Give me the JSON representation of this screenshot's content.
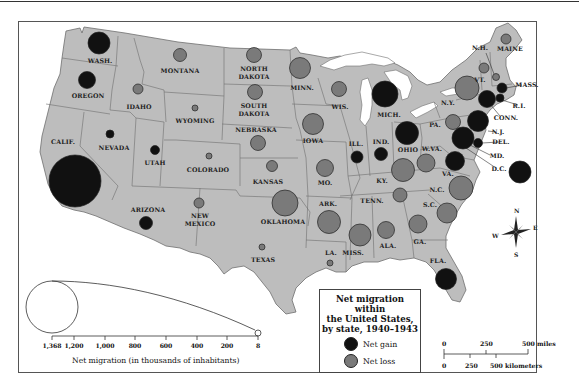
{
  "title": "Net migration within the United States, by state, 1940–1943",
  "colors": {
    "land": "#bdbdbd",
    "border": "#6e6e6e",
    "water": "#ffffff",
    "gain": "#111111",
    "loss": "#7a7a7a",
    "frame": "#555555"
  },
  "legend": {
    "title_line1": "Net migration within",
    "title_line2": "the United States,",
    "title_line3": "by state, 1940–1943",
    "gain_label": "Net gain",
    "loss_label": "Net loss"
  },
  "size_key": {
    "title": "Net migration (in thousands of inhabitants)",
    "ticks": [
      {
        "label": "1,368",
        "x": 52
      },
      {
        "label": "1,200",
        "x": 74
      },
      {
        "label": "1,000",
        "x": 105
      },
      {
        "label": "800",
        "x": 135
      },
      {
        "label": "600",
        "x": 166
      },
      {
        "label": "400",
        "x": 197
      },
      {
        "label": "200",
        "x": 227
      },
      {
        "label": "8",
        "x": 258
      }
    ]
  },
  "scale_bar": {
    "miles_labels": [
      "0",
      "250",
      "500 miles"
    ],
    "km_labels": [
      "0",
      "250",
      "500 kilometers"
    ]
  },
  "compass": {
    "n": "N",
    "s": "S",
    "e": "E",
    "w": "W"
  },
  "chart_data": {
    "type": "proportional-symbol-map",
    "title": "Net migration within the United States, by state, 1940–1943",
    "size_legend_label": "Net migration (in thousands of inhabitants)",
    "size_legend_range": [
      8,
      1368
    ],
    "size_legend_ticks": [
      1368,
      1200,
      1000,
      800,
      600,
      400,
      200,
      8
    ],
    "categories": [
      "Net gain",
      "Net loss"
    ],
    "states": [
      {
        "name": "WASH.",
        "type": "gain",
        "cx": 99,
        "cy": 43,
        "r": 11
      },
      {
        "name": "OREGON",
        "type": "gain",
        "cx": 87,
        "cy": 80,
        "r": 8.5
      },
      {
        "name": "CALIF.",
        "type": "gain",
        "cx": 75,
        "cy": 181,
        "r": 26
      },
      {
        "name": "NEVADA",
        "type": "gain",
        "cx": 110,
        "cy": 134,
        "r": 4
      },
      {
        "name": "IDAHO",
        "type": "loss",
        "cx": 138,
        "cy": 89,
        "r": 5
      },
      {
        "name": "MONTANA",
        "type": "loss",
        "cx": 180,
        "cy": 55,
        "r": 6.5
      },
      {
        "name": "WYOMING",
        "type": "loss",
        "cx": 195,
        "cy": 108,
        "r": 3
      },
      {
        "name": "UTAH",
        "type": "gain",
        "cx": 155,
        "cy": 150,
        "r": 4.5
      },
      {
        "name": "COLORADO",
        "type": "loss",
        "cx": 209,
        "cy": 156,
        "r": 3
      },
      {
        "name": "ARIZONA",
        "type": "gain",
        "cx": 146,
        "cy": 223,
        "r": 6.5
      },
      {
        "name": "NEW MEXICO",
        "type": "loss",
        "cx": 199,
        "cy": 203,
        "r": 5
      },
      {
        "name": "NORTH DAKOTA",
        "type": "loss",
        "cx": 254,
        "cy": 55,
        "r": 7.5
      },
      {
        "name": "SOUTH DAKOTA",
        "type": "loss",
        "cx": 255,
        "cy": 92,
        "r": 7.5
      },
      {
        "name": "NEBRASKA",
        "type": "loss",
        "cx": 258,
        "cy": 143,
        "r": 7.5
      },
      {
        "name": "KANSAS",
        "type": "loss",
        "cx": 272,
        "cy": 166,
        "r": 5.5
      },
      {
        "name": "OKLAHOMA",
        "type": "loss",
        "cx": 285,
        "cy": 203,
        "r": 13
      },
      {
        "name": "TEXAS",
        "type": "loss",
        "cx": 262,
        "cy": 247,
        "r": 3
      },
      {
        "name": "MINN.",
        "type": "loss",
        "cx": 300,
        "cy": 68,
        "r": 10.5
      },
      {
        "name": "IOWA",
        "type": "loss",
        "cx": 313,
        "cy": 124,
        "r": 10.5
      },
      {
        "name": "MO.",
        "type": "loss",
        "cx": 325,
        "cy": 168,
        "r": 8.5
      },
      {
        "name": "ARK.",
        "type": "loss",
        "cx": 329,
        "cy": 222,
        "r": 11.5
      },
      {
        "name": "LA.",
        "type": "loss",
        "cx": 330,
        "cy": 263,
        "r": 3
      },
      {
        "name": "WIS.",
        "type": "loss",
        "cx": 339,
        "cy": 89,
        "r": 7.5
      },
      {
        "name": "ILL.",
        "type": "gain",
        "cx": 357,
        "cy": 157,
        "r": 6
      },
      {
        "name": "MICH.",
        "type": "gain",
        "cx": 385,
        "cy": 94,
        "r": 13
      },
      {
        "name": "IND.",
        "type": "gain",
        "cx": 381,
        "cy": 154,
        "r": 6.5
      },
      {
        "name": "OHIO",
        "type": "gain",
        "cx": 407,
        "cy": 133,
        "r": 11.5
      },
      {
        "name": "KY.",
        "type": "loss",
        "cx": 403,
        "cy": 170,
        "r": 11.5
      },
      {
        "name": "TENN.",
        "type": "loss",
        "cx": 400,
        "cy": 195,
        "r": 7
      },
      {
        "name": "MISS.",
        "type": "loss",
        "cx": 360,
        "cy": 235,
        "r": 11
      },
      {
        "name": "ALA.",
        "type": "loss",
        "cx": 386,
        "cy": 230,
        "r": 8.5
      },
      {
        "name": "GA.",
        "type": "loss",
        "cx": 418,
        "cy": 224,
        "r": 9
      },
      {
        "name": "FLA.",
        "type": "gain",
        "cx": 446,
        "cy": 279,
        "r": 10.5
      },
      {
        "name": "S.C.",
        "type": "loss",
        "cx": 447,
        "cy": 213,
        "r": 10
      },
      {
        "name": "N.C.",
        "type": "loss",
        "cx": 461,
        "cy": 188,
        "r": 12
      },
      {
        "name": "VA.",
        "type": "gain",
        "cx": 455,
        "cy": 161,
        "r": 9.5
      },
      {
        "name": "W.VA.",
        "type": "loss",
        "cx": 426,
        "cy": 163,
        "r": 9
      },
      {
        "name": "PA.",
        "type": "loss",
        "cx": 453,
        "cy": 122,
        "r": 7.5
      },
      {
        "name": "N.Y.",
        "type": "loss",
        "cx": 467,
        "cy": 88,
        "r": 12
      },
      {
        "name": "N.J.",
        "type": "gain",
        "cx": 478,
        "cy": 121,
        "r": 10.5
      },
      {
        "name": "DEL.",
        "type": "gain",
        "cx": 478,
        "cy": 143,
        "r": 4.5
      },
      {
        "name": "MD.",
        "type": "gain",
        "cx": 463,
        "cy": 138,
        "r": 11
      },
      {
        "name": "D.C.",
        "type": "gain",
        "cx": 520,
        "cy": 172,
        "r": 11
      },
      {
        "name": "CONN.",
        "type": "gain",
        "cx": 487,
        "cy": 99,
        "r": 8.5
      },
      {
        "name": "R.I.",
        "type": "gain",
        "cx": 500,
        "cy": 98,
        "r": 4
      },
      {
        "name": "MASS.",
        "type": "gain",
        "cx": 502,
        "cy": 88,
        "r": 5
      },
      {
        "name": "VT.",
        "type": "loss",
        "cx": 484,
        "cy": 68,
        "r": 5
      },
      {
        "name": "N.H.",
        "type": "loss",
        "cx": 496,
        "cy": 77,
        "r": 3.5
      },
      {
        "name": "MAINE",
        "type": "loss",
        "cx": 506,
        "cy": 39,
        "r": 5
      }
    ]
  },
  "labels": [
    {
      "t": "WASH.",
      "x": 100,
      "y": 63
    },
    {
      "t": "OREGON",
      "x": 88,
      "y": 98
    },
    {
      "t": "CALIF.",
      "x": 63,
      "y": 144
    },
    {
      "t": "NEVADA",
      "x": 114,
      "y": 150
    },
    {
      "t": "IDAHO",
      "x": 139,
      "y": 109
    },
    {
      "t": "MONTANA",
      "x": 180,
      "y": 73
    },
    {
      "t": "WYOMING",
      "x": 195,
      "y": 123
    },
    {
      "t": "UTAH",
      "x": 155,
      "y": 165
    },
    {
      "t": "COLORADO",
      "x": 208,
      "y": 172
    },
    {
      "t": "ARIZONA",
      "x": 148,
      "y": 212
    },
    {
      "t": "NEW",
      "x": 200,
      "y": 218
    },
    {
      "t": "MEXICO",
      "x": 200,
      "y": 226
    },
    {
      "t": "NORTH",
      "x": 254,
      "y": 71
    },
    {
      "t": "DAKOTA",
      "x": 254,
      "y": 79
    },
    {
      "t": "SOUTH",
      "x": 254,
      "y": 108
    },
    {
      "t": "DAKOTA",
      "x": 254,
      "y": 116
    },
    {
      "t": "NEBRASKA",
      "x": 256,
      "y": 132
    },
    {
      "t": "KANSAS",
      "x": 268,
      "y": 184
    },
    {
      "t": "OKLAHOMA",
      "x": 283,
      "y": 224
    },
    {
      "t": "TEXAS",
      "x": 263,
      "y": 262
    },
    {
      "t": "MINN.",
      "x": 302,
      "y": 90
    },
    {
      "t": "IOWA",
      "x": 313,
      "y": 143
    },
    {
      "t": "MO.",
      "x": 325,
      "y": 185
    },
    {
      "t": "ARK.",
      "x": 328,
      "y": 206
    },
    {
      "t": "LA.",
      "x": 331,
      "y": 255
    },
    {
      "t": "WIS.",
      "x": 340,
      "y": 109
    },
    {
      "t": "ILL.",
      "x": 356,
      "y": 146
    },
    {
      "t": "MICH.",
      "x": 389,
      "y": 117
    },
    {
      "t": "IND.",
      "x": 381,
      "y": 144
    },
    {
      "t": "OHIO",
      "x": 408,
      "y": 152
    },
    {
      "t": "KY.",
      "x": 382,
      "y": 183
    },
    {
      "t": "TENN.",
      "x": 372,
      "y": 203
    },
    {
      "t": "MISS.",
      "x": 353,
      "y": 255
    },
    {
      "t": "ALA.",
      "x": 388,
      "y": 248
    },
    {
      "t": "GA.",
      "x": 420,
      "y": 244
    },
    {
      "t": "FLA.",
      "x": 438,
      "y": 263
    },
    {
      "t": "S.C.",
      "x": 430,
      "y": 207
    },
    {
      "t": "N.C.",
      "x": 437,
      "y": 192
    },
    {
      "t": "VA.",
      "x": 448,
      "y": 176
    },
    {
      "t": "W.VA.",
      "x": 432,
      "y": 151
    },
    {
      "t": "PA.",
      "x": 435,
      "y": 127
    },
    {
      "t": "N.Y.",
      "x": 448,
      "y": 105
    },
    {
      "t": "N.J.",
      "x": 498,
      "y": 134
    },
    {
      "t": "DEL.",
      "x": 501,
      "y": 144
    },
    {
      "t": "MD.",
      "x": 497,
      "y": 158
    },
    {
      "t": "D.C.",
      "x": 499,
      "y": 171
    },
    {
      "t": "CONN.",
      "x": 506,
      "y": 120
    },
    {
      "t": "R.I.",
      "x": 519,
      "y": 108
    },
    {
      "t": "MASS.",
      "x": 527,
      "y": 87
    },
    {
      "t": "VT.",
      "x": 480,
      "y": 82
    },
    {
      "t": "N.H.",
      "x": 480,
      "y": 50
    },
    {
      "t": "MAINE",
      "x": 510,
      "y": 51
    }
  ]
}
